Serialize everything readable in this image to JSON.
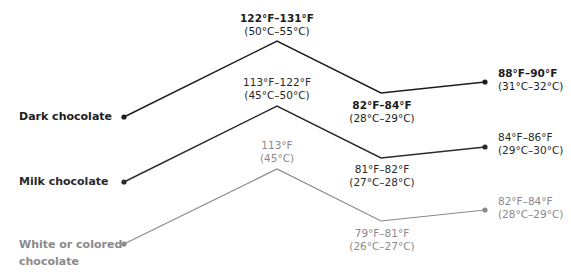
{
  "diagram": {
    "stages": [
      "start",
      "melt",
      "cool",
      "working"
    ],
    "series": [
      {
        "name": "Dark chocolate",
        "color": "#1c1c1c",
        "label": "Dark chocolate",
        "points": [
          {
            "stage": "start",
            "f": "",
            "c": ""
          },
          {
            "stage": "melt",
            "f": "122°F–131°F",
            "c": "(50°C–55°C)"
          },
          {
            "stage": "cool",
            "f": "82°F–84°F",
            "c": "(28°C–29°C)"
          },
          {
            "stage": "working",
            "f": "88°F–90°F",
            "c": "(31°C–32°C)"
          }
        ]
      },
      {
        "name": "Milk chocolate",
        "color": "#2a2a2a",
        "label": "Milk chocolate",
        "points": [
          {
            "stage": "start",
            "f": "",
            "c": ""
          },
          {
            "stage": "melt",
            "f": "113°F–122°F",
            "c": "(45°C–50°C)"
          },
          {
            "stage": "cool",
            "f": "81°F–82°F",
            "c": "(27°C–28°C)"
          },
          {
            "stage": "working",
            "f": "84°F–86°F",
            "c": "(29°C–30°C)"
          }
        ]
      },
      {
        "name": "White or colored chocolate",
        "color": "#8a8a8a",
        "label_line1": "White or colored",
        "label_line2": "chocolate",
        "points": [
          {
            "stage": "start",
            "f": "",
            "c": ""
          },
          {
            "stage": "melt",
            "f": "113°F",
            "c": "(45°C)"
          },
          {
            "stage": "cool",
            "f": "79°F–81°F",
            "c": "(26°C–27°C)"
          },
          {
            "stage": "working",
            "f": "82°F–84°F",
            "c": "(28°C–29°C)"
          }
        ]
      }
    ]
  }
}
